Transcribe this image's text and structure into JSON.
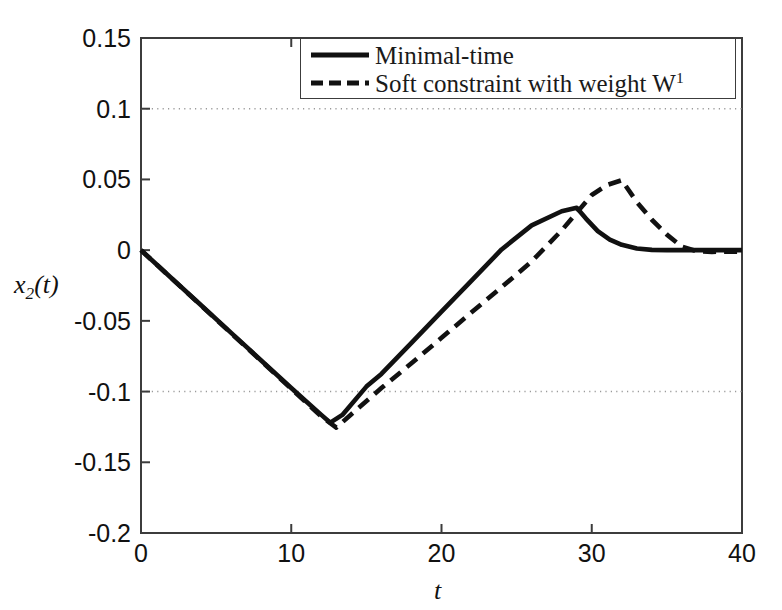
{
  "figure": {
    "background_color": "#ffffff",
    "axis_color": "#3c3c3c",
    "curve_color": "#111111",
    "grid_color": "#9a9a9a"
  },
  "axes": {
    "x_label": "t",
    "y_label_base": "x",
    "y_label_sub": "2",
    "y_label_tail": "(t)",
    "y_label_full": "x2(t)",
    "x_ticks": [
      "0",
      "10",
      "20",
      "30",
      "40"
    ],
    "x_tick_values": [
      0,
      10,
      20,
      30,
      40
    ],
    "y_ticks": [
      "0.15",
      "0.1",
      "0.05",
      "0",
      "-0.05",
      "-0.1",
      "-0.15",
      "-0.2"
    ],
    "y_tick_values": [
      0.15,
      0.1,
      0.05,
      0,
      -0.05,
      -0.1,
      -0.15,
      -0.2
    ],
    "gridlines_y": [
      0.1,
      -0.1
    ],
    "grid_style": "dotted"
  },
  "legend": {
    "position": "top-right",
    "entries": [
      {
        "label": "Minimal-time",
        "style": "solid"
      },
      {
        "label": "Soft constraint with weight W",
        "label_sup": "1",
        "style": "dashed"
      }
    ]
  },
  "chart_data": {
    "type": "line",
    "title": "",
    "xlabel": "t",
    "ylabel": "x2(t)",
    "xlim": [
      0,
      40
    ],
    "ylim": [
      -0.2,
      0.15
    ],
    "grid": true,
    "grid_lines": [
      0.1,
      -0.1
    ],
    "legend_position": "upper right",
    "series": [
      {
        "name": "Minimal-time",
        "style": "solid",
        "x": [
          0,
          2,
          4,
          6,
          8,
          10,
          11,
          12,
          12.6,
          13.4,
          15,
          16,
          18,
          20,
          22,
          24,
          26,
          28,
          29,
          29.6,
          30.4,
          31.2,
          32,
          33,
          34,
          35,
          36,
          38,
          40
        ],
        "y": [
          0,
          -0.0195,
          -0.039,
          -0.0585,
          -0.078,
          -0.0975,
          -0.107,
          -0.1165,
          -0.122,
          -0.1165,
          -0.0965,
          -0.0875,
          -0.0655,
          -0.0435,
          -0.0215,
          0.0005,
          0.0175,
          0.0275,
          0.03,
          0.0225,
          0.0135,
          0.0075,
          0.0038,
          0.0012,
          0.0002,
          0.0,
          0.0,
          0.0,
          0.0
        ]
      },
      {
        "name": "Soft constraint with weight W1",
        "style": "dashed",
        "x": [
          0,
          2,
          4,
          6,
          8,
          10,
          11,
          12,
          13,
          14,
          16,
          18,
          20,
          22,
          24,
          26,
          28,
          30,
          31,
          32,
          33,
          34,
          35,
          36,
          37,
          38,
          40
        ],
        "y": [
          0,
          -0.0196,
          -0.0392,
          -0.0588,
          -0.0784,
          -0.098,
          -0.1078,
          -0.1176,
          -0.1255,
          -0.116,
          -0.0975,
          -0.08,
          -0.062,
          -0.044,
          -0.0262,
          -0.008,
          0.014,
          0.039,
          0.046,
          0.0495,
          0.034,
          0.0215,
          0.011,
          0.0025,
          -0.0008,
          -0.0012,
          -0.001
        ]
      }
    ]
  }
}
